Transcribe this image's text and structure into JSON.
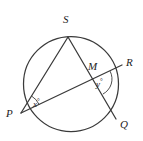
{
  "figure": {
    "kind": "circle-geometry-diagram",
    "background_color": "#ffffff",
    "stroke_color": "#3a3a3a",
    "label_color": "#1d1d1d",
    "width": 143,
    "height": 141,
    "circle": {
      "cx": 71,
      "cy": 84,
      "r": 47.5
    },
    "points": {
      "S": {
        "x": 68,
        "y": 37,
        "label": "S",
        "label_x": 63,
        "label_y": 19
      },
      "P": {
        "x": 21,
        "y": 113,
        "label": "P",
        "label_x": 8,
        "label_y": 114
      },
      "R": {
        "x": 122,
        "y": 65,
        "label": "R",
        "label_x": 126,
        "label_y": 60
      },
      "Q": {
        "x": 116,
        "y": 119,
        "label": "Q",
        "label_x": 120,
        "label_y": 122
      },
      "M": {
        "x": 95,
        "y": 79,
        "label": "M",
        "label_x": 89,
        "label_y": 65
      }
    },
    "chords": [
      {
        "name": "chord-SP",
        "from": "S",
        "to": "P"
      },
      {
        "name": "chord-SQ",
        "from": "S",
        "to": "Q"
      },
      {
        "name": "chord-PR",
        "from": "P",
        "to": "R"
      }
    ],
    "angles": [
      {
        "name": "angle-x-at-P",
        "label": "x",
        "degree_symbol": "°",
        "vertex": "P",
        "label_x": 33,
        "label_y": 99,
        "arc": {
          "cx": 21,
          "cy": 113,
          "r": 20
        }
      },
      {
        "name": "angle-y-at-M",
        "label": "y",
        "degree_symbol": "°",
        "vertex": "M",
        "label_x": 97,
        "label_y": 79,
        "arc": {
          "cx": 95,
          "cy": 79,
          "r": 17
        }
      }
    ]
  }
}
